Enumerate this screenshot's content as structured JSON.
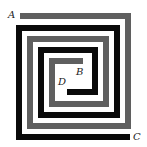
{
  "diagram": {
    "type": "interleaved-square-spirals",
    "stroke_width": 6,
    "labels": {
      "a": "A",
      "b": "B",
      "c": "C",
      "d": "D"
    },
    "spirals": [
      {
        "name": "gray-spiral",
        "from": "A",
        "to": "B",
        "color": "#5f5f5f",
        "points": "20,16 128,16 128,126 30,126 30,39 106,39 106,104 52,104 52,61 83,61"
      },
      {
        "name": "black-spiral",
        "from": "C",
        "to": "D",
        "color": "#0a0a0a",
        "points": "130,137 19,137 19,28 117,28 117,115 41,115 41,50 95,50 95,92 67,92"
      }
    ]
  }
}
